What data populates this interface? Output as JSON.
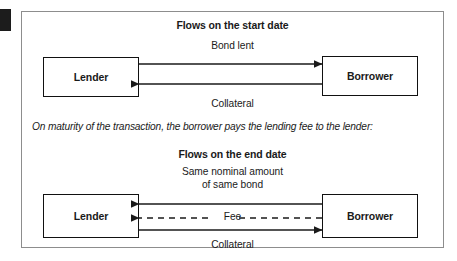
{
  "figure": {
    "left_marker": "black-tab-marker",
    "frame_border_color": "#8d8d8d",
    "line_color": "#1a1a1a"
  },
  "start_section": {
    "heading": "Flows on the start date",
    "lender_label": "Lender",
    "borrower_label": "Borrower",
    "arrow_top_label": "Bond lent",
    "arrow_bottom_label": "Collateral"
  },
  "note": {
    "text": "On maturity of the transaction, the borrower pays the lending fee to the lender:"
  },
  "end_section": {
    "heading": "Flows on the end date",
    "lender_label": "Lender",
    "borrower_label": "Borrower",
    "arrow_top_label_line1": "Same nominal amount",
    "arrow_top_label_line2": "of same bond",
    "arrow_middle_label": "Fee",
    "arrow_bottom_label": "Collateral"
  }
}
